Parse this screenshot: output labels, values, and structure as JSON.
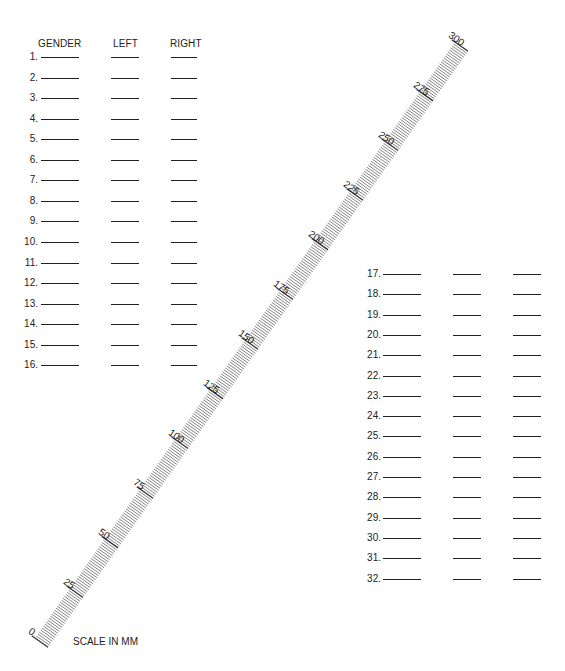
{
  "headers": {
    "gender": "GENDER",
    "left": "LEFT",
    "right": "RIGHT"
  },
  "rows_left": [
    "1.",
    "2.",
    "3.",
    "4.",
    "5.",
    "6.",
    "7.",
    "8.",
    "9.",
    "10.",
    "11.",
    "12.",
    "13.",
    "14.",
    "15.",
    "16."
  ],
  "rows_right": [
    "17.",
    "18.",
    "19.",
    "20.",
    "21.",
    "22.",
    "23.",
    "24.",
    "25.",
    "26.",
    "27.",
    "28.",
    "29.",
    "30.",
    "31.",
    "32."
  ],
  "ruler": {
    "unit": "mm",
    "min": 0,
    "max": 300,
    "major_step": 25,
    "labels": [
      "0",
      "25",
      "50",
      "75",
      "100",
      "125",
      "150",
      "175",
      "200",
      "225",
      "250",
      "275",
      "300"
    ]
  },
  "caption": "SCALE IN MM"
}
